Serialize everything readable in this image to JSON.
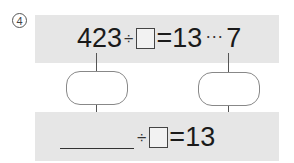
{
  "problem": {
    "number_label": "4",
    "top_equation": {
      "dividend": "423",
      "operator": "÷",
      "divisor_blank": "",
      "equals": "=",
      "quotient": "13",
      "remainder_separator": "···",
      "remainder": "7"
    },
    "left_oval": {
      "value": ""
    },
    "right_oval": {
      "value": ""
    },
    "bottom_equation": {
      "dividend_blank": "",
      "operator": "÷",
      "divisor_blank": "",
      "equals": "=",
      "quotient": "13"
    }
  },
  "colors": {
    "panel": "#e6e6e6",
    "text": "#1a1a1a",
    "lines": "#555555"
  }
}
